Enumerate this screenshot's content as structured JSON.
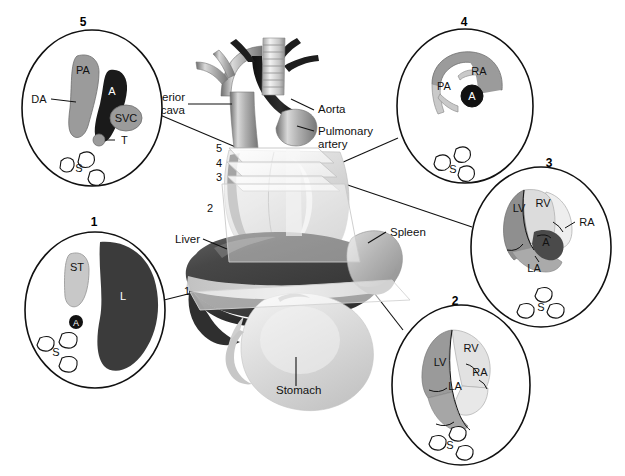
{
  "figure": {
    "type": "anatomical-diagram"
  },
  "central_labels": [
    {
      "id": "superior-vena-cava",
      "line1": "Superior",
      "line2": "vena cava",
      "x": 183,
      "y": 101,
      "anchor": "end"
    },
    {
      "id": "aorta",
      "line1": "Aorta",
      "line2": "",
      "x": 317,
      "y": 113,
      "anchor": "start"
    },
    {
      "id": "pulmonary-artery",
      "line1": "Pulmonary",
      "line2": "artery",
      "x": 317,
      "y": 135,
      "anchor": "start"
    },
    {
      "id": "liver",
      "line1": "Liver",
      "line2": "",
      "x": 199,
      "y": 242,
      "anchor": "end"
    },
    {
      "id": "spleen",
      "line1": "Spleen",
      "line2": "",
      "x": 389,
      "y": 235,
      "anchor": "start"
    },
    {
      "id": "stomach",
      "line1": "Stomach",
      "line2": "",
      "x": 283,
      "y": 391,
      "anchor": "start"
    }
  ],
  "plane_markers": [
    {
      "id": "plane-5",
      "label": "5",
      "x": 222,
      "y": 148
    },
    {
      "id": "plane-4",
      "label": "4",
      "x": 222,
      "y": 163
    },
    {
      "id": "plane-3",
      "label": "3",
      "x": 222,
      "y": 177
    },
    {
      "id": "plane-2",
      "label": "2",
      "x": 208,
      "y": 208
    },
    {
      "id": "plane-1",
      "label": "1",
      "x": 185,
      "y": 292
    }
  ],
  "circles": [
    {
      "id": "circle-5",
      "number": "5",
      "number_x": 83,
      "number_y": 22,
      "cx": 92,
      "cy": 108,
      "rx": 70,
      "ry": 78,
      "caption": "Plane 5 — three vessel / tracheal view",
      "structures": [
        {
          "id": "pa",
          "label": "PA",
          "lx": 83,
          "ly": 70,
          "tone": "#9b9b9b",
          "text": "#111111"
        },
        {
          "id": "a",
          "label": "A",
          "lx": 104,
          "ly": 93,
          "tone": "#1a1a1a",
          "text": "#ffffff"
        },
        {
          "id": "svc",
          "label": "SVC",
          "lx": 126,
          "ly": 118,
          "tone": "#9b9b9b",
          "text": "#111111"
        },
        {
          "id": "da",
          "label": "DA",
          "lx": 37,
          "ly": 99,
          "tone": "none",
          "text": "#111111"
        },
        {
          "id": "t",
          "label": "T",
          "lx": 101,
          "ly": 140,
          "tone": "#9b9b9b",
          "text": "#111111"
        },
        {
          "id": "s",
          "label": "S",
          "lx": 79,
          "ly": 166,
          "tone": "none",
          "text": "#111111"
        }
      ]
    },
    {
      "id": "circle-4",
      "number": "4",
      "number_x": 464,
      "number_y": 22,
      "cx": 465,
      "cy": 106,
      "rx": 68,
      "ry": 77,
      "caption": "Plane 4 — right ventricular outflow tract view",
      "structures": [
        {
          "id": "ra",
          "label": "RA",
          "lx": 478,
          "ly": 71,
          "tone": "#9b9b9b",
          "text": "#111111"
        },
        {
          "id": "pa",
          "label": "PA",
          "lx": 443,
          "ly": 86,
          "tone": "#c9c9c9",
          "text": "#111111"
        },
        {
          "id": "a",
          "label": "A",
          "lx": 473,
          "ly": 97,
          "tone": "#1a1a1a",
          "text": "#ffffff"
        },
        {
          "id": "s",
          "label": "S",
          "lx": 454,
          "ly": 167,
          "tone": "none",
          "text": "#111111"
        }
      ]
    },
    {
      "id": "circle-3",
      "number": "3",
      "number_x": 549,
      "number_y": 163,
      "cx": 541,
      "cy": 247,
      "rx": 70,
      "ry": 80,
      "caption": "Plane 3 — five chamber / long axis view",
      "structures": [
        {
          "id": "lv",
          "label": "LV",
          "lx": 520,
          "ly": 208,
          "tone": "#8f8f8f",
          "text": "#111111"
        },
        {
          "id": "rv",
          "label": "RV",
          "lx": 545,
          "ly": 203,
          "tone": "#dcdcdc",
          "text": "#111111"
        },
        {
          "id": "ra",
          "label": "RA",
          "lx": 580,
          "ly": 222,
          "tone": "#eeeeee",
          "text": "#111111"
        },
        {
          "id": "a",
          "label": "A",
          "lx": 545,
          "ly": 239,
          "tone": "#4a4a4a",
          "text": "#111111"
        },
        {
          "id": "la",
          "label": "LA",
          "lx": 535,
          "ly": 256,
          "tone": "#aaaaaa",
          "text": "#111111"
        },
        {
          "id": "s",
          "label": "S",
          "lx": 540,
          "ly": 300,
          "tone": "none",
          "text": "#111111"
        }
      ]
    },
    {
      "id": "circle-2",
      "number": "2",
      "number_x": 455,
      "number_y": 301,
      "cx": 461,
      "cy": 385,
      "rx": 69,
      "ry": 80,
      "caption": "Plane 2 — four chamber view",
      "structures": [
        {
          "id": "rv",
          "label": "RV",
          "lx": 471,
          "ly": 348,
          "tone": "#e2e2e2",
          "text": "#111111"
        },
        {
          "id": "lv",
          "label": "LV",
          "lx": 442,
          "ly": 362,
          "tone": "#9a9a9a",
          "text": "#111111"
        },
        {
          "id": "ra",
          "label": "RA",
          "lx": 481,
          "ly": 371,
          "tone": "#e8e8e8",
          "text": "#111111"
        },
        {
          "id": "la",
          "label": "LA",
          "lx": 455,
          "ly": 383,
          "tone": "#a6a6a6",
          "text": "#111111"
        },
        {
          "id": "s",
          "label": "S",
          "lx": 449,
          "ly": 440,
          "tone": "none",
          "text": "#111111"
        }
      ]
    },
    {
      "id": "circle-1",
      "number": "1",
      "number_x": 94,
      "number_y": 222,
      "cx": 95,
      "cy": 310,
      "rx": 70,
      "ry": 78,
      "caption": "Plane 1 — upper abdominal / stomach view",
      "structures": [
        {
          "id": "st",
          "label": "ST",
          "lx": 77,
          "ly": 266,
          "tone": "#c8c8c8",
          "text": "#111111"
        },
        {
          "id": "l",
          "label": "L",
          "lx": 116,
          "ly": 295,
          "tone": "#3b3b3b",
          "text": "#ffffff"
        },
        {
          "id": "a",
          "label": "A",
          "lx": 76,
          "ly": 322,
          "tone": "#111111",
          "text": "#ffffff"
        },
        {
          "id": "s",
          "label": "S",
          "lx": 56,
          "ly": 348,
          "tone": "none",
          "text": "#111111"
        }
      ]
    }
  ],
  "legend_keys": {
    "PA": "pulmonary artery",
    "A": "aorta",
    "SVC": "superior vena cava",
    "DA": "ductus arteriosus",
    "T": "trachea",
    "S": "spine",
    "RA": "right atrium",
    "LA": "left atrium",
    "RV": "right ventricle",
    "LV": "left ventricle",
    "ST": "stomach",
    "L": "liver"
  },
  "colors": {
    "outline": "#1a1a1a",
    "background": "#ffffff",
    "dark_organ": "#3b3b3b",
    "mid_gray": "#9b9b9b",
    "light_gray": "#d6d6d6",
    "plane_stroke": "#bdbdbd"
  }
}
